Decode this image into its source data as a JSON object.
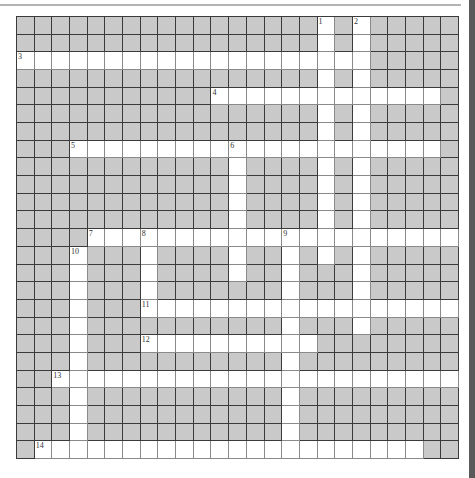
{
  "puzzle": {
    "rows": 25,
    "cols": 25,
    "colors": {
      "blocked": "#c9c9c9",
      "open": "#ffffff",
      "grid_line": "#3a3a3a"
    },
    "open_cells": [
      [
        17,
        19
      ],
      [
        17,
        19
      ],
      [
        0,
        1,
        2,
        3,
        4,
        5,
        6,
        7,
        8,
        9,
        10,
        11,
        12,
        13,
        14,
        15,
        16,
        17,
        18,
        19
      ],
      [
        17,
        19
      ],
      [
        11,
        12,
        13,
        14,
        15,
        16,
        17,
        18,
        19,
        20,
        21,
        22,
        23
      ],
      [
        17,
        19
      ],
      [
        17,
        19
      ],
      [
        3,
        4,
        5,
        6,
        7,
        8,
        9,
        10,
        11,
        12,
        13,
        14,
        15,
        16,
        17,
        18,
        19,
        20,
        21,
        22,
        23
      ],
      [
        12,
        17,
        19
      ],
      [
        12,
        17,
        19
      ],
      [
        12,
        17,
        19
      ],
      [
        12,
        17,
        19
      ],
      [
        4,
        5,
        6,
        7,
        8,
        9,
        10,
        11,
        12,
        13,
        14,
        15,
        16,
        17,
        18,
        19,
        20,
        21,
        22,
        23,
        24
      ],
      [
        3,
        7,
        12,
        15,
        17,
        19
      ],
      [
        3,
        7,
        12,
        15,
        19
      ],
      [
        3,
        7,
        15,
        19
      ],
      [
        3,
        7,
        8,
        9,
        10,
        11,
        12,
        13,
        14,
        15,
        16,
        17,
        18,
        19,
        20,
        21,
        22,
        23,
        24
      ],
      [
        3,
        15,
        19
      ],
      [
        3,
        7,
        8,
        9,
        10,
        11,
        12,
        13,
        14,
        15,
        16
      ],
      [
        3,
        15
      ],
      [
        2,
        3,
        4,
        5,
        6,
        7,
        8,
        9,
        10,
        11,
        12,
        13,
        14,
        15,
        16,
        17,
        18,
        19,
        20,
        21,
        22,
        23,
        24
      ],
      [
        3,
        15
      ],
      [
        3,
        15
      ],
      [
        3,
        15
      ],
      [
        1,
        2,
        3,
        4,
        5,
        6,
        7,
        8,
        9,
        10,
        11,
        12,
        13,
        14,
        15,
        16,
        17,
        18,
        19,
        20,
        21,
        22
      ]
    ],
    "clue_numbers": [
      {
        "number": "1",
        "row": 0,
        "col": 17,
        "direction": "down"
      },
      {
        "number": "2",
        "row": 0,
        "col": 19,
        "direction": "down"
      },
      {
        "number": "3",
        "row": 2,
        "col": 0,
        "direction": "across"
      },
      {
        "number": "4",
        "row": 4,
        "col": 11,
        "direction": "across"
      },
      {
        "number": "5",
        "row": 7,
        "col": 3,
        "direction": "across"
      },
      {
        "number": "6",
        "row": 7,
        "col": 12,
        "direction": "down"
      },
      {
        "number": "7",
        "row": 12,
        "col": 4,
        "direction": "across"
      },
      {
        "number": "8",
        "row": 12,
        "col": 7,
        "direction": "down"
      },
      {
        "number": "9",
        "row": 12,
        "col": 15,
        "direction": "down"
      },
      {
        "number": "10",
        "row": 13,
        "col": 3,
        "direction": "down"
      },
      {
        "number": "11",
        "row": 16,
        "col": 7,
        "direction": "across"
      },
      {
        "number": "12",
        "row": 18,
        "col": 7,
        "direction": "across"
      },
      {
        "number": "13",
        "row": 20,
        "col": 2,
        "direction": "across"
      },
      {
        "number": "14",
        "row": 24,
        "col": 1,
        "direction": "across"
      }
    ]
  }
}
